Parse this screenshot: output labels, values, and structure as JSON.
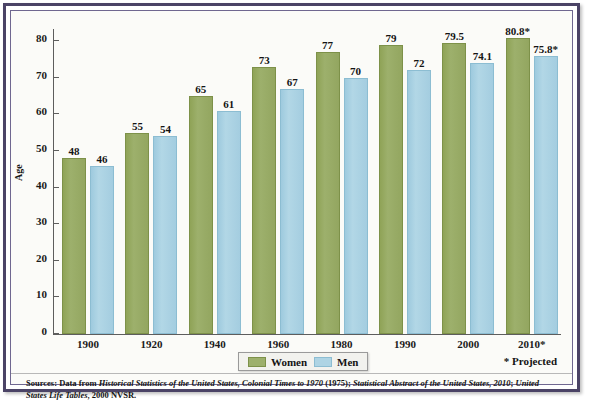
{
  "chart_data": {
    "type": "bar",
    "title": "",
    "xlabel": "",
    "ylabel": "Age",
    "ylim": [
      0,
      80
    ],
    "ytick_step": 10,
    "yticks": [
      80,
      70,
      60,
      50,
      40,
      30,
      20,
      10,
      0
    ],
    "categories": [
      "1900",
      "1920",
      "1940",
      "1960",
      "1980",
      "1990",
      "2000",
      "2010*"
    ],
    "grid": false,
    "legend_position": "bottom-center",
    "series": [
      {
        "name": "Women",
        "color": "#9db06c",
        "values": [
          48,
          55,
          65,
          73,
          77,
          79,
          79.5,
          80.8
        ],
        "labels": [
          "48",
          "55",
          "65",
          "73",
          "77",
          "79",
          "79.5",
          "80.8*"
        ]
      },
      {
        "name": "Men",
        "color": "#aed4e4",
        "values": [
          46,
          54,
          61,
          67,
          70,
          72,
          74.1,
          75.8
        ],
        "labels": [
          "46",
          "54",
          "61",
          "67",
          "70",
          "72",
          "74.1",
          "75.8*"
        ]
      }
    ],
    "annotations": [
      "* Projected"
    ]
  },
  "axis": {
    "y_title": "Age"
  },
  "legend": {
    "women_label": "Women",
    "men_label": "Men"
  },
  "notes": {
    "projected": "* Projected"
  },
  "sources": {
    "prefix": "Sources: Data from ",
    "italic_1": "Historical Statistics of the United States, Colonial Times to 1970",
    "mid_1": " (1975); ",
    "italic_2": "Statistical Abstract of the United States, 2010",
    "mid_2": "; ",
    "italic_3": "United States Life Tables",
    "suffix": ", 2000 NVSR."
  }
}
